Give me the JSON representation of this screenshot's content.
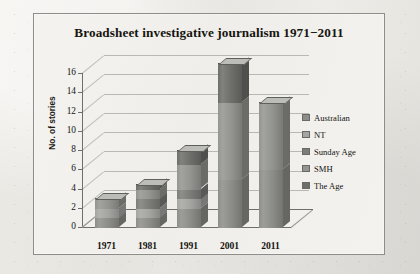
{
  "chart_data": {
    "type": "bar",
    "title": "Broadsheet investigative journalism 1971−2011",
    "xlabel": "",
    "ylabel": "No. of stories",
    "categories": [
      "1971",
      "1981",
      "1991",
      "2001",
      "2011"
    ],
    "ylim": [
      0,
      16
    ],
    "yticks": [
      "0",
      "2",
      "4",
      "6",
      "8",
      "10",
      "12",
      "14",
      "16"
    ],
    "grid": true,
    "stacked": true,
    "three_d": true,
    "legend_position": "right",
    "series": [
      {
        "name": "Australian",
        "color": "#8d8d8a",
        "values": [
          1,
          1,
          2,
          5,
          6
        ]
      },
      {
        "name": "NT",
        "color": "#a5a5a2",
        "values": [
          1,
          1,
          1,
          0,
          0
        ]
      },
      {
        "name": "Sunday Age",
        "color": "#7c7c79",
        "values": [
          0,
          1,
          1,
          0,
          0
        ]
      },
      {
        "name": "SMH",
        "color": "#949491",
        "values": [
          1,
          1,
          2.5,
          8,
          7
        ]
      },
      {
        "name": "The Age",
        "color": "#6e6e6b",
        "values": [
          0,
          0.5,
          1.5,
          4,
          0
        ]
      }
    ],
    "totals": [
      3,
      4.5,
      8,
      17,
      13
    ]
  },
  "legend": {
    "items": [
      {
        "label": "Australian"
      },
      {
        "label": "NT"
      },
      {
        "label": "Sunday Age"
      },
      {
        "label": "SMH"
      },
      {
        "label": "The Age"
      }
    ]
  }
}
